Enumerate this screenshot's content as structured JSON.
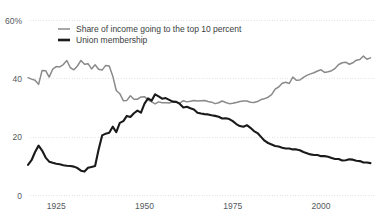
{
  "chart_data": {
    "type": "line",
    "title": "",
    "subtitle": "",
    "xlabel": "",
    "ylabel": "",
    "xlim": [
      1917,
      2015
    ],
    "ylim": [
      0,
      60
    ],
    "grid": true,
    "grid_axis": "y",
    "legend_position": "top-left-inside",
    "y_ticks": [
      {
        "value": 60,
        "label": "60%"
      },
      {
        "value": 40,
        "label": "40"
      },
      {
        "value": 20,
        "label": "20"
      },
      {
        "value": 0,
        "label": "0"
      }
    ],
    "x_ticks": [
      {
        "value": 1925,
        "label": "1925"
      },
      {
        "value": 1950,
        "label": "1950"
      },
      {
        "value": 1975,
        "label": "1975"
      },
      {
        "value": 2000,
        "label": "2000"
      }
    ],
    "series": [
      {
        "name": "Share of income going to the top 10 percent",
        "color": "#8a8a8a",
        "width": 1.5,
        "x": [
          1917,
          1918,
          1919,
          1920,
          1921,
          1922,
          1923,
          1924,
          1925,
          1926,
          1927,
          1928,
          1929,
          1930,
          1931,
          1932,
          1933,
          1934,
          1935,
          1936,
          1937,
          1938,
          1939,
          1940,
          1941,
          1942,
          1943,
          1944,
          1945,
          1946,
          1947,
          1948,
          1949,
          1950,
          1951,
          1952,
          1953,
          1954,
          1955,
          1956,
          1957,
          1958,
          1959,
          1960,
          1961,
          1962,
          1963,
          1964,
          1965,
          1966,
          1967,
          1968,
          1969,
          1970,
          1971,
          1972,
          1973,
          1974,
          1975,
          1976,
          1977,
          1978,
          1979,
          1980,
          1981,
          1982,
          1983,
          1984,
          1985,
          1986,
          1987,
          1988,
          1989,
          1990,
          1991,
          1992,
          1993,
          1994,
          1995,
          1996,
          1997,
          1998,
          1999,
          2000,
          2001,
          2002,
          2003,
          2004,
          2005,
          2006,
          2007,
          2008,
          2009,
          2010,
          2011,
          2012,
          2013,
          2014
        ],
        "values": [
          40.4,
          39.9,
          39.5,
          38.1,
          42.9,
          42.8,
          40.6,
          43.3,
          44.2,
          44.1,
          44.9,
          46.3,
          43.8,
          43.1,
          44.4,
          46.3,
          45.0,
          45.2,
          43.4,
          44.8,
          43.3,
          43.0,
          44.6,
          44.4,
          41.0,
          36.0,
          34.9,
          32.5,
          32.6,
          34.2,
          33.0,
          33.0,
          33.8,
          33.9,
          32.8,
          32.1,
          31.4,
          32.1,
          31.8,
          31.8,
          31.7,
          32.1,
          32.0,
          31.7,
          32.5,
          32.1,
          32.3,
          32.6,
          32.4,
          32.5,
          32.6,
          32.2,
          32.0,
          31.5,
          31.8,
          32.4,
          31.9,
          31.5,
          31.6,
          31.9,
          32.2,
          32.4,
          32.4,
          32.0,
          31.9,
          32.2,
          32.9,
          33.2,
          33.7,
          34.6,
          36.5,
          37.2,
          38.5,
          38.8,
          38.4,
          40.6,
          39.5,
          39.6,
          40.5,
          41.2,
          41.7,
          42.1,
          42.7,
          43.1,
          42.2,
          42.4,
          42.8,
          43.6,
          44.9,
          45.5,
          45.7,
          45.0,
          45.5,
          46.4,
          46.6,
          47.8,
          46.7,
          47.2
        ]
      },
      {
        "name": "Union membership",
        "color": "#1a1a1a",
        "width": 2.1,
        "x": [
          1917,
          1918,
          1919,
          1920,
          1921,
          1922,
          1923,
          1924,
          1925,
          1926,
          1927,
          1928,
          1929,
          1930,
          1931,
          1932,
          1933,
          1934,
          1935,
          1936,
          1937,
          1938,
          1939,
          1940,
          1941,
          1942,
          1943,
          1944,
          1945,
          1946,
          1947,
          1948,
          1949,
          1950,
          1951,
          1952,
          1953,
          1954,
          1955,
          1956,
          1957,
          1958,
          1959,
          1960,
          1961,
          1962,
          1963,
          1964,
          1965,
          1966,
          1967,
          1968,
          1969,
          1970,
          1971,
          1972,
          1973,
          1974,
          1975,
          1976,
          1977,
          1978,
          1979,
          1980,
          1981,
          1982,
          1983,
          1984,
          1985,
          1986,
          1987,
          1988,
          1989,
          1990,
          1991,
          1992,
          1993,
          1994,
          1995,
          1996,
          1997,
          1998,
          1999,
          2000,
          2001,
          2002,
          2003,
          2004,
          2005,
          2006,
          2007,
          2008,
          2009,
          2010,
          2011,
          2012,
          2013,
          2014
        ],
        "values": [
          10.5,
          12.1,
          14.9,
          17.1,
          15.4,
          13.0,
          11.6,
          11.2,
          10.9,
          10.7,
          10.4,
          10.2,
          10.1,
          9.9,
          9.4,
          8.5,
          8.2,
          9.5,
          9.8,
          10.1,
          15.8,
          20.6,
          21.2,
          21.5,
          23.6,
          21.7,
          24.9,
          25.5,
          27.3,
          26.9,
          28.2,
          29.1,
          28.4,
          31.5,
          33.3,
          32.5,
          34.7,
          34.0,
          33.2,
          33.4,
          32.8,
          32.2,
          32.1,
          31.4,
          30.2,
          30.4,
          29.9,
          29.5,
          28.4,
          28.1,
          27.9,
          27.8,
          27.5,
          27.3,
          27.0,
          26.4,
          26.5,
          26.2,
          25.5,
          24.5,
          23.8,
          23.6,
          24.1,
          23.2,
          22.1,
          21.4,
          20.1,
          18.8,
          18.0,
          17.5,
          17.0,
          16.8,
          16.4,
          16.1,
          16.1,
          15.8,
          15.8,
          15.5,
          14.9,
          14.5,
          14.1,
          13.9,
          13.9,
          13.5,
          13.5,
          13.3,
          12.9,
          12.5,
          12.5,
          12.0,
          12.1,
          12.4,
          12.3,
          11.9,
          11.8,
          11.3,
          11.3,
          11.1
        ]
      }
    ],
    "legend": [
      {
        "label": "Share of income going to the top 10 percent",
        "color": "#8a8a8a",
        "style": "thin-line"
      },
      {
        "label": "Union membership",
        "color": "#1a1a1a",
        "style": "thick-line"
      }
    ]
  },
  "colors": {
    "background": "#ffffff",
    "gridline": "#d8d8d8",
    "axis_text": "#55595c",
    "legend_text": "#3a3d40"
  }
}
